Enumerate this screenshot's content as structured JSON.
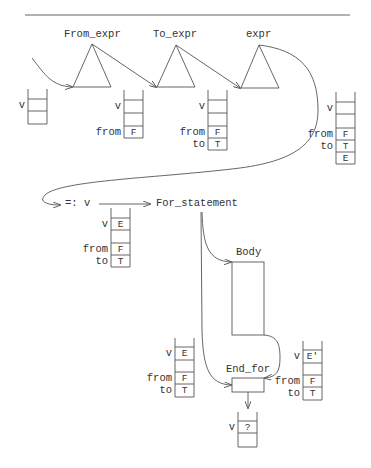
{
  "nodes": {
    "from_expr": "From_expr",
    "to_expr": "To_expr",
    "expr": "expr",
    "assign": "=: v",
    "for_statement": "For_statement",
    "body": "Body",
    "end_for": "End_for"
  },
  "stacks": {
    "s1": {
      "labels": [
        "v"
      ],
      "cells": [
        "",
        ""
      ]
    },
    "s2": {
      "labels": [
        "v",
        "from"
      ],
      "cells": [
        "",
        "",
        "F"
      ]
    },
    "s3": {
      "labels": [
        "v",
        "from",
        "to"
      ],
      "cells": [
        "",
        "",
        "F",
        "T"
      ]
    },
    "s4": {
      "labels": [
        "v",
        "from",
        "to"
      ],
      "cells": [
        "",
        "",
        "F",
        "T",
        "E"
      ]
    },
    "s5": {
      "labels": [
        "v",
        "from",
        "to"
      ],
      "cells": [
        "E",
        "",
        "F",
        "T"
      ]
    },
    "s6": {
      "labels": [
        "v",
        "from",
        "to"
      ],
      "cells": [
        "E",
        "",
        "F",
        "T"
      ]
    },
    "s7": {
      "labels": [
        "v",
        "from",
        "to"
      ],
      "cells": [
        "E'",
        "",
        "F",
        "T"
      ]
    },
    "s8": {
      "labels": [
        "v"
      ],
      "cells": [
        "?",
        ""
      ]
    }
  },
  "colors": {
    "line": "#555555",
    "text": "#333333"
  }
}
